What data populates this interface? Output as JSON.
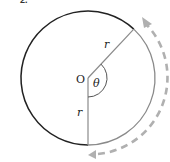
{
  "figure_label": "2.",
  "labels": {
    "origin": "O",
    "angle": "θ",
    "radius_top": "r",
    "radius_bottom": "r"
  },
  "colors": {
    "circle_major": "#222222",
    "circle_arc": "#8a8a8a",
    "radius_lines": "#8a8a8a",
    "dashed_arrow": "#b0b0b0",
    "text": "#222222"
  },
  "geometry": {
    "center": [
      88,
      78
    ],
    "radius": 67,
    "angle_deg": 138
  }
}
